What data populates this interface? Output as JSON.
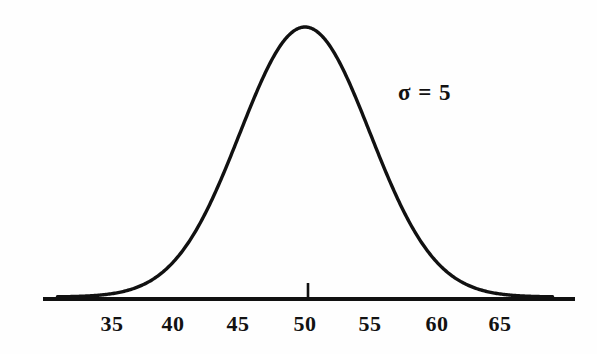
{
  "figure": {
    "background_color": "#fefefe",
    "ink_color": "#111111",
    "annotation": {
      "text": "σ = 5",
      "symbol": "σ",
      "relation": "=",
      "value": "5",
      "x": 398,
      "y": 81
    },
    "axis": {
      "x_start": 43,
      "x_end": 575,
      "y": 299,
      "thickness": 4
    },
    "center_tick": {
      "x": 308,
      "y_top": 283,
      "y_bottom": 297,
      "value": "50"
    }
  },
  "chart_data": {
    "type": "line",
    "title": "",
    "subtitle": "",
    "xlabel": "",
    "ylabel": "",
    "grid": false,
    "legend": null,
    "distribution": "normal",
    "mean": 50,
    "sigma": 5,
    "annotations": [
      {
        "text": "σ = 5",
        "x": 57.5,
        "y_rel": 0.78
      }
    ],
    "xlim": [
      31,
      69
    ],
    "ylim": [
      0,
      1
    ],
    "xticks": [
      35,
      40,
      45,
      50,
      55,
      60,
      65
    ],
    "xtick_labels": [
      "35",
      "40",
      "45",
      "50",
      "55",
      "60",
      "65"
    ],
    "xtick_pixels": [
      112,
      173,
      238,
      305,
      370,
      437,
      500
    ],
    "tick_marks_drawn": [
      50
    ],
    "x": [
      31,
      32,
      33,
      34,
      35,
      36,
      37,
      38,
      39,
      40,
      41,
      42,
      43,
      44,
      45,
      46,
      47,
      48,
      49,
      50,
      51,
      52,
      53,
      54,
      55,
      56,
      57,
      58,
      59,
      60,
      61,
      62,
      63,
      64,
      65,
      66,
      67,
      68,
      69
    ],
    "y": [
      0.0001,
      0.0003,
      0.0007,
      0.0015,
      0.0111,
      0.0198,
      0.034,
      0.0561,
      0.0889,
      0.1353,
      0.1979,
      0.278,
      0.3753,
      0.4868,
      0.6065,
      0.7261,
      0.8353,
      0.9231,
      0.9802,
      1.0,
      0.9802,
      0.9231,
      0.8353,
      0.7261,
      0.6065,
      0.4868,
      0.3753,
      0.278,
      0.1979,
      0.1353,
      0.0889,
      0.0561,
      0.034,
      0.0198,
      0.0111,
      0.006,
      0.0031,
      0.0015,
      0.0007
    ],
    "peak": {
      "x": 50,
      "y": 1.0,
      "pixel_x": 308,
      "pixel_y": 27
    },
    "baseline_pixel_y": 297
  },
  "axis_labels": [
    {
      "text": "35",
      "x": 112
    },
    {
      "text": "40",
      "x": 173
    },
    {
      "text": "45",
      "x": 238
    },
    {
      "text": "50",
      "x": 305
    },
    {
      "text": "55",
      "x": 370
    },
    {
      "text": "60",
      "x": 437
    },
    {
      "text": "65",
      "x": 500
    }
  ]
}
